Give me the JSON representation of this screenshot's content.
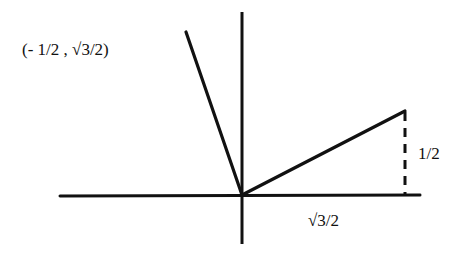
{
  "diagram": {
    "type": "unit-circle-angle-rays",
    "colors": {
      "line": "#111111",
      "background": "#ffffff"
    },
    "axes": {
      "horizontal": {
        "x1": 60,
        "y1": 196,
        "x2": 420,
        "y2": 195
      },
      "vertical": {
        "x1": 242,
        "y1": 12,
        "x2": 242,
        "y2": 244
      }
    },
    "origin": {
      "x": 242,
      "y": 195
    },
    "rays": [
      {
        "name": "ray-to-second-quadrant-point",
        "x2": 186,
        "y2": 32
      },
      {
        "name": "ray-to-first-quadrant-point",
        "x2": 405,
        "y2": 111
      }
    ],
    "dashed_segment": {
      "x1": 405,
      "y1": 112,
      "x2": 405,
      "y2": 195
    },
    "labels": {
      "point_label": "(- 1/2 , √3/2)",
      "vertical_leg": "1/2",
      "horizontal_leg": "√3/2"
    }
  }
}
